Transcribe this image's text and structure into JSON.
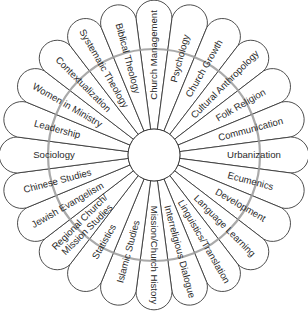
{
  "diagram": {
    "type": "radial-petal-wheel",
    "center": {
      "x": 154,
      "y": 155
    },
    "hub_radius": 26,
    "ring_radius": 106,
    "petal_radius": 152,
    "petal_count": 24,
    "colors": {
      "outline": "#3a3a3a",
      "ring": "#9a9a9a",
      "text": "#2a2a2a",
      "background": "#ffffff"
    },
    "petals": [
      {
        "label": "Church Management"
      },
      {
        "label": "Psychology"
      },
      {
        "label": "Church Growth"
      },
      {
        "label": "Cultural Anthropology"
      },
      {
        "label": "Folk Religion"
      },
      {
        "label": "Communication"
      },
      {
        "label": "Urbanization"
      },
      {
        "label": "Ecumenics"
      },
      {
        "label": "Development"
      },
      {
        "label": "Language Learning"
      },
      {
        "label": "Linguistics/Translation"
      },
      {
        "label": "Interreligious Dialogue"
      },
      {
        "label": "Mission/Church History"
      },
      {
        "label": "Islamic Studies"
      },
      {
        "label": "Statistics"
      },
      {
        "label": "Regional Church/ Mission Studies",
        "lines": [
          "Regional Church/",
          "Mission Studies"
        ]
      },
      {
        "label": "Jewish Evangelism"
      },
      {
        "label": "Chinese Studies"
      },
      {
        "label": "Sociology"
      },
      {
        "label": "Leadership"
      },
      {
        "label": "Women in Ministry"
      },
      {
        "label": "Contextualization"
      },
      {
        "label": "Systematic Theology"
      },
      {
        "label": "Biblical Theology"
      }
    ]
  }
}
